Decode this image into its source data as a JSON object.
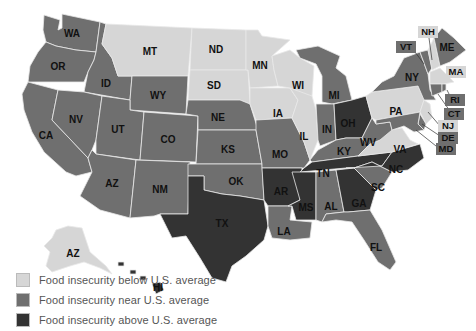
{
  "colors": {
    "below": "#d6d6d6",
    "near": "#6f6f6f",
    "above": "#333333"
  },
  "legend": [
    {
      "category": "below",
      "label": "Food insecurity below U.S. average"
    },
    {
      "category": "near",
      "label": "Food insecurity near U.S. average"
    },
    {
      "category": "above",
      "label": "Food insecurity above U.S. average"
    }
  ],
  "states": {
    "WA": {
      "label": "WA",
      "category": "near"
    },
    "OR": {
      "label": "OR",
      "category": "near"
    },
    "CA": {
      "label": "CA",
      "category": "near"
    },
    "ID": {
      "label": "ID",
      "category": "near"
    },
    "NV": {
      "label": "NV",
      "category": "near"
    },
    "MT": {
      "label": "MT",
      "category": "below"
    },
    "WY": {
      "label": "WY",
      "category": "near"
    },
    "UT": {
      "label": "UT",
      "category": "near"
    },
    "AZ": {
      "label": "AZ",
      "category": "near"
    },
    "CO": {
      "label": "CO",
      "category": "near"
    },
    "NM": {
      "label": "NM",
      "category": "near"
    },
    "ND": {
      "label": "ND",
      "category": "below"
    },
    "SD": {
      "label": "SD",
      "category": "below"
    },
    "NE": {
      "label": "NE",
      "category": "near"
    },
    "KS": {
      "label": "KS",
      "category": "near"
    },
    "OK": {
      "label": "OK",
      "category": "near"
    },
    "TX": {
      "label": "TX",
      "category": "above"
    },
    "MN": {
      "label": "MN",
      "category": "below"
    },
    "IA": {
      "label": "IA",
      "category": "below"
    },
    "MO": {
      "label": "MO",
      "category": "near"
    },
    "AR": {
      "label": "AR",
      "category": "above"
    },
    "LA": {
      "label": "LA",
      "category": "near"
    },
    "WI": {
      "label": "WI",
      "category": "below"
    },
    "IL": {
      "label": "IL",
      "category": "below"
    },
    "MI": {
      "label": "MI",
      "category": "near"
    },
    "IN": {
      "label": "IN",
      "category": "near"
    },
    "OH": {
      "label": "OH",
      "category": "above"
    },
    "KY": {
      "label": "KY",
      "category": "near"
    },
    "TN": {
      "label": "TN",
      "category": "above"
    },
    "MS": {
      "label": "MS",
      "category": "above"
    },
    "AL": {
      "label": "AL",
      "category": "near"
    },
    "GA": {
      "label": "GA",
      "category": "above"
    },
    "FL": {
      "label": "FL",
      "category": "near"
    },
    "SC": {
      "label": "SC",
      "category": "near"
    },
    "NC": {
      "label": "NC",
      "category": "above"
    },
    "VA": {
      "label": "VA",
      "category": "below"
    },
    "WV": {
      "label": "WV",
      "category": "near"
    },
    "PA": {
      "label": "PA",
      "category": "below"
    },
    "NY": {
      "label": "NY",
      "category": "near"
    },
    "VT": {
      "label": "VT",
      "category": "near"
    },
    "NH": {
      "label": "NH",
      "category": "below"
    },
    "ME": {
      "label": "ME",
      "category": "near"
    },
    "MA": {
      "label": "MA",
      "category": "below"
    },
    "RI": {
      "label": "RI",
      "category": "near"
    },
    "CT": {
      "label": "CT",
      "category": "near"
    },
    "NJ": {
      "label": "NJ",
      "category": "below"
    },
    "DE": {
      "label": "DE",
      "category": "near"
    },
    "MD": {
      "label": "MD",
      "category": "near"
    },
    "AK": {
      "label": "AZ",
      "category": "below"
    },
    "HI": {
      "label": "HI",
      "category": "above"
    }
  }
}
